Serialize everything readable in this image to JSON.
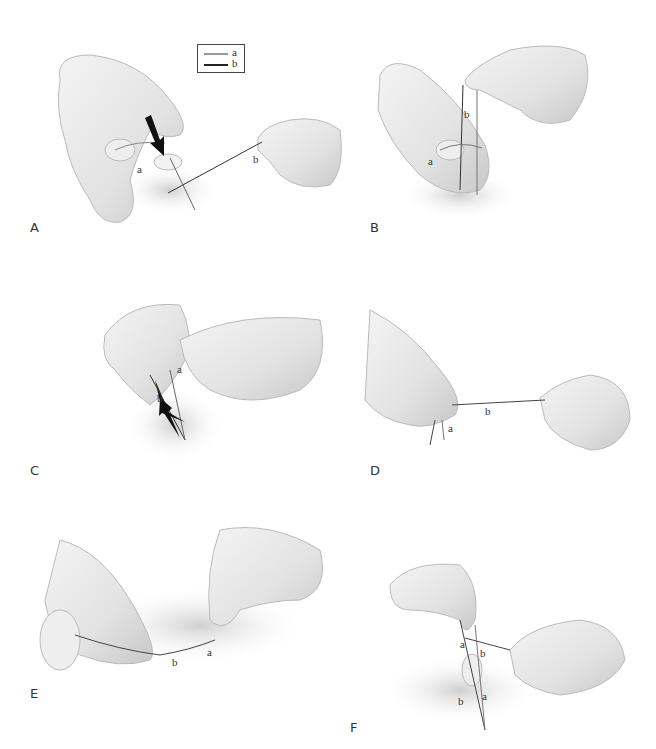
{
  "figure": {
    "legend": {
      "items": [
        {
          "label": "a",
          "color": "#9a9a9a"
        },
        {
          "label": "b",
          "color": "#222222"
        }
      ]
    },
    "panels": [
      {
        "id": "A",
        "label": "A",
        "thread_labels": [
          "a",
          "b"
        ]
      },
      {
        "id": "B",
        "label": "B",
        "thread_labels": [
          "b",
          "a"
        ]
      },
      {
        "id": "C",
        "label": "C",
        "thread_labels": [
          "a",
          "b"
        ]
      },
      {
        "id": "D",
        "label": "D",
        "thread_labels": [
          "b",
          "a"
        ]
      },
      {
        "id": "E",
        "label": "E",
        "thread_labels": [
          "b",
          "a"
        ]
      },
      {
        "id": "F",
        "label": "F",
        "thread_labels": [
          "a",
          "b",
          "b",
          "a"
        ]
      }
    ]
  }
}
